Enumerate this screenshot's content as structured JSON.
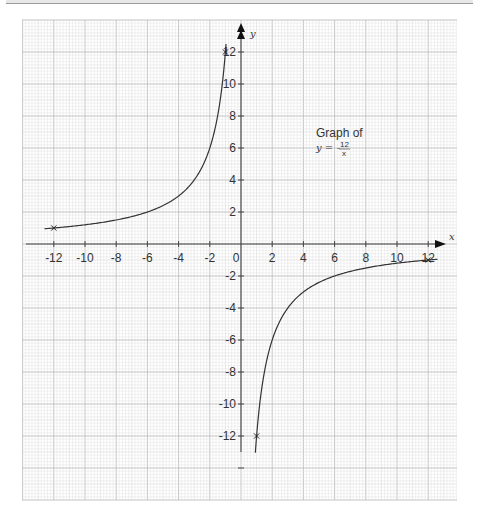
{
  "chart_data": {
    "type": "line",
    "title": "Graph of",
    "equation": {
      "lhs": "y = -",
      "numerator": "12",
      "denominator": "x"
    },
    "xlabel": "x",
    "ylabel": "y",
    "xlim": [
      -14,
      14
    ],
    "ylim": [
      -16,
      14
    ],
    "grid": true,
    "x_ticks": [
      -12,
      -10,
      -8,
      -6,
      -4,
      -2,
      0,
      2,
      4,
      6,
      8,
      10,
      12
    ],
    "y_ticks": [
      12,
      10,
      8,
      6,
      4,
      2,
      -2,
      -4,
      -6,
      -8,
      -10,
      -12
    ],
    "x_tick_labels": [
      "-12",
      "-10",
      "-8",
      "-6",
      "-4",
      "-2",
      "0",
      "2",
      "4",
      "6",
      "8",
      "10",
      "12"
    ],
    "y_tick_labels": [
      "12",
      "10",
      "8",
      "6",
      "4",
      "2",
      "-2",
      "-4",
      "-6",
      "-8",
      "-10",
      "-12"
    ],
    "series": [
      {
        "name": "y = -12/x (x < 0)",
        "x_range": [
          -12.6,
          -0.96
        ],
        "points": [
          {
            "x": -12,
            "y": 1
          },
          {
            "x": -10,
            "y": 1.2
          },
          {
            "x": -8,
            "y": 1.5
          },
          {
            "x": -6,
            "y": 2
          },
          {
            "x": -4,
            "y": 3
          },
          {
            "x": -3,
            "y": 4
          },
          {
            "x": -2,
            "y": 6
          },
          {
            "x": -1.5,
            "y": 8
          },
          {
            "x": -1.2,
            "y": 10
          },
          {
            "x": -1,
            "y": 12
          }
        ]
      },
      {
        "name": "y = -12/x (x > 0)",
        "x_range": [
          0.92,
          12.6
        ],
        "points": [
          {
            "x": 1,
            "y": -12
          },
          {
            "x": 1.2,
            "y": -10
          },
          {
            "x": 1.5,
            "y": -8
          },
          {
            "x": 2,
            "y": -6
          },
          {
            "x": 3,
            "y": -4
          },
          {
            "x": 4,
            "y": -3
          },
          {
            "x": 6,
            "y": -2
          },
          {
            "x": 8,
            "y": -1.5
          },
          {
            "x": 10,
            "y": -1.2
          },
          {
            "x": 12,
            "y": -1
          }
        ]
      }
    ],
    "marked_points": [
      {
        "x": -12,
        "y": 1
      },
      {
        "x": -1,
        "y": 12
      },
      {
        "x": 1,
        "y": -12
      },
      {
        "x": 12,
        "y": -1
      }
    ],
    "annotation": {
      "text": "Graph of y = -12/x",
      "position": [
        6,
        6.5
      ]
    }
  },
  "colors": {
    "curve": "#333333",
    "axis": "#444444",
    "grid_major": "#bdbdbd",
    "grid_minor": "#e2e2e2"
  }
}
